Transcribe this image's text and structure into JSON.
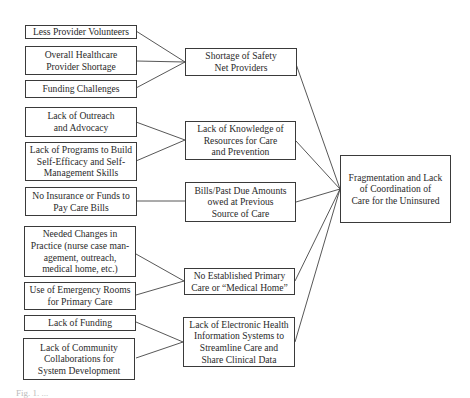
{
  "diagram": {
    "type": "cause-effect flow diagram",
    "causes": [
      {
        "id": "c1",
        "label": "Less Provider Volunteers",
        "target": "m1"
      },
      {
        "id": "c2",
        "label": "Overall Healthcare\nProvider Shortage",
        "target": "m1"
      },
      {
        "id": "c3",
        "label": "Funding Challenges",
        "target": "m1"
      },
      {
        "id": "c4",
        "label": "Lack of Outreach\nand Advocacy",
        "target": "m2"
      },
      {
        "id": "c5",
        "label": "Lack of Programs to Build\nSelf-Efficacy and Self-\nManagement Skills",
        "target": "m2"
      },
      {
        "id": "c6",
        "label": "No Insurance or Funds to\nPay Care Bills",
        "target": "m3"
      },
      {
        "id": "c7",
        "label": "Needed Changes in\nPractice (nurse case man-\nagement, outreach,\nmedical home, etc.)",
        "target": "m4"
      },
      {
        "id": "c8",
        "label": "Use of Emergency Rooms\nfor Primary Care",
        "target": "m4"
      },
      {
        "id": "c9",
        "label": "Lack of Funding",
        "target": "m5"
      },
      {
        "id": "c10",
        "label": "Lack of Community\nCollaborations for\nSystem Development",
        "target": "m5"
      }
    ],
    "intermediate": [
      {
        "id": "m1",
        "label": "Shortage of Safety\nNet Providers"
      },
      {
        "id": "m2",
        "label": "Lack of Knowledge of\nResources for Care\nand Prevention"
      },
      {
        "id": "m3",
        "label": "Bills/Past Due Amounts\nowed at Previous\nSource of Care"
      },
      {
        "id": "m4",
        "label": "No Established Primary\nCare or “Medical Home”"
      },
      {
        "id": "m5",
        "label": "Lack of Electronic Health\nInformation Systems to\nStreamline Care and\nShare Clinical Data"
      }
    ],
    "outcome": {
      "id": "o1",
      "label": "Fragmentation and Lack\nof Coordination of\nCare for the Uninsured"
    },
    "caption": "Fig. 1. ..."
  },
  "colors": {
    "line": "#3a3a3a",
    "border": "#3a3a3a",
    "text": "#2a2a2a",
    "background": "#ffffff"
  }
}
